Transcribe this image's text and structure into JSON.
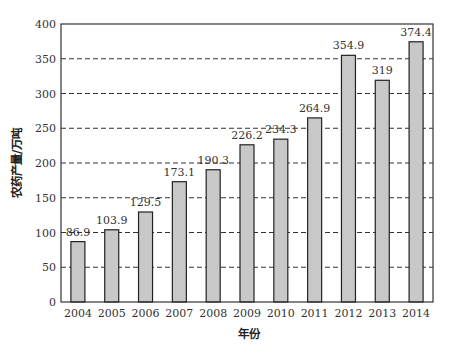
{
  "chart_data": {
    "type": "bar",
    "title": "",
    "xlabel": "年份",
    "ylabel": "农药产量/万吨",
    "categories": [
      "2004",
      "2005",
      "2006",
      "2007",
      "2008",
      "2009",
      "2010",
      "2011",
      "2012",
      "2013",
      "2014"
    ],
    "values": [
      86.9,
      103.9,
      129.5,
      173.1,
      190.3,
      226.2,
      234.3,
      264.9,
      354.9,
      319,
      374.4
    ],
    "value_labels": [
      "86.9",
      "103.9",
      "129.5",
      "173.1",
      "190.3",
      "226.2",
      "234.3",
      "264.9",
      "354.9",
      "319",
      "374.4"
    ],
    "ylim": [
      0,
      400
    ],
    "yticks": [
      0,
      50,
      100,
      150,
      200,
      250,
      300,
      350,
      400
    ],
    "grid": "horizontal dashed",
    "legend": "none",
    "bar_color": "#c8c8c8",
    "bar_edge_color": "#222222"
  }
}
